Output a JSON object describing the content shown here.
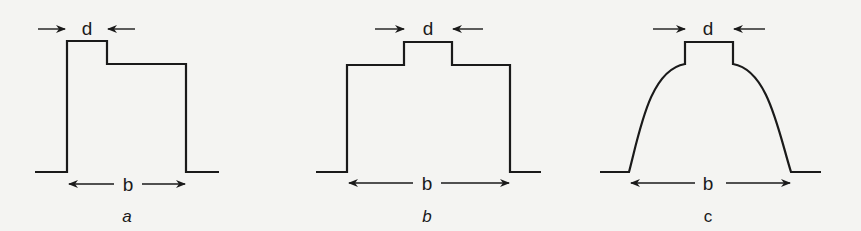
{
  "panels": [
    {
      "id": "a",
      "label": "a",
      "label_style": "italic",
      "shape": "step-down-right",
      "top_width_label": "d",
      "base_width_label": "b"
    },
    {
      "id": "b",
      "label": "b",
      "label_style": "italic",
      "shape": "centered-step",
      "top_width_label": "d",
      "base_width_label": "b"
    },
    {
      "id": "c",
      "label": "c",
      "label_style": "normal",
      "shape": "rounded-with-centered-step",
      "top_width_label": "d",
      "base_width_label": "b"
    }
  ]
}
